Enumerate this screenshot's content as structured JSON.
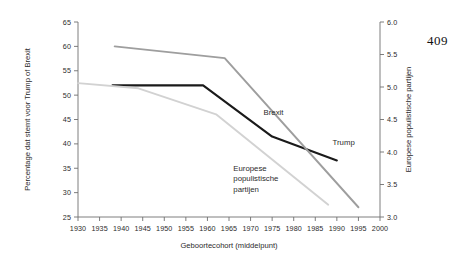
{
  "page": {
    "number": "409"
  },
  "chart_data": {
    "type": "line",
    "title": "",
    "xlabel": "Geboortecohort (middelpunt)",
    "ylabel": "Percentage dat stemt voor Trump of Brexit",
    "y2label": "Europese populistische partijen",
    "xlim": [
      1930,
      2000
    ],
    "ylim": [
      25,
      65
    ],
    "y2lim": [
      3.0,
      6.0
    ],
    "grid": false,
    "legend_position": "inline-annotations",
    "xticks": [
      "1930",
      "1935",
      "1940",
      "1945",
      "1950",
      "1955",
      "1960",
      "1965",
      "1970",
      "1975",
      "1980",
      "1985",
      "1990",
      "1995",
      "2000"
    ],
    "yticks": [
      "25",
      "30",
      "35",
      "40",
      "45",
      "50",
      "55",
      "60",
      "65"
    ],
    "y2ticks": [
      "3.0",
      "3.5",
      "4.0",
      "4.5",
      "5.0",
      "5.5",
      "6.0"
    ],
    "series": [
      {
        "name": "Trump",
        "axis": "left",
        "color": "#1a1a1a",
        "width": 2.1,
        "label_text": "Trump",
        "label_x": 1989,
        "label_y": 39.8,
        "x": [
          1938,
          1959,
          1975,
          1990
        ],
        "values": [
          52.0,
          52.0,
          41.5,
          36.6
        ]
      },
      {
        "name": "Brexit",
        "axis": "left",
        "color": "#9e9e9e",
        "width": 1.9,
        "label_text": "Brexit",
        "label_x": 1973,
        "label_y": 46.0,
        "x": [
          1938.5,
          1964,
          1995
        ],
        "values": [
          60.0,
          57.6,
          27.0
        ]
      },
      {
        "name": "Europese populistische partijen",
        "axis": "right",
        "color": "#d2d2d2",
        "width": 1.9,
        "label_text_lines": [
          "Europese",
          "populistische",
          "partijen"
        ],
        "label_x": 1966,
        "label_y": 34.5,
        "x": [
          1930,
          1944,
          1962,
          1988
        ],
        "values": [
          5.06,
          4.98,
          4.58,
          3.19
        ]
      }
    ]
  }
}
